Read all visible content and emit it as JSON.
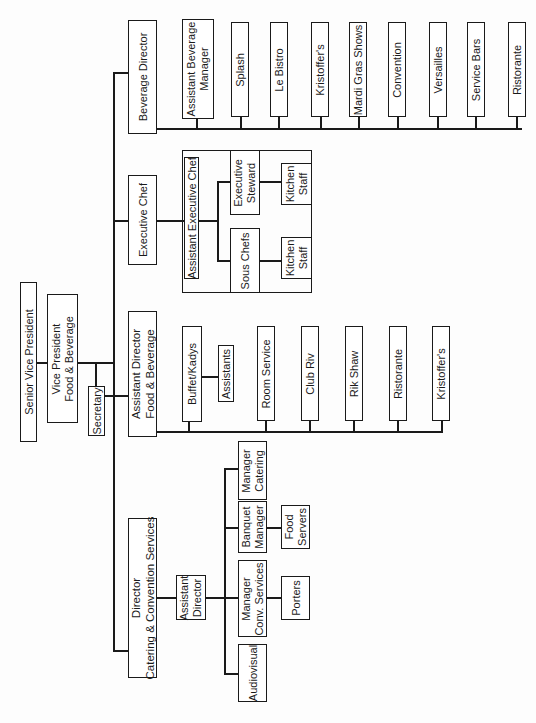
{
  "chart": {
    "orientation": "rotated-90-ccw"
  },
  "nodes": {
    "senior_vp": "Senior Vice President",
    "vp_fb": "Vice President\nFood & Beverage",
    "secretary": "Secretary",
    "beverage_director": "Beverage Director",
    "executive_chef": "Executive Chef",
    "asst_director_fb": "Assistant Director\nFood & Beverage",
    "director_catering": "Director\nCatering & Convention Services",
    "asst_beverage_manager": "Assistant Beverage\nManager",
    "splash": "Splash",
    "le_bistro": "Le Bistro",
    "kristoffers_bev": "Kristoffer's",
    "mardi_gras": "Mardi Gras Shows",
    "convention": "Convention",
    "versailles": "Versailles",
    "service_bars": "Service Bars",
    "ristorante_bev": "Ristorante",
    "asst_exec_chef": "Assistant Executive Chef",
    "executive_steward": "Executive\nSteward",
    "sous_chefs": "Sous Chefs",
    "kitchen_staff_1": "Kitchen\nStaff",
    "kitchen_staff_2": "Kitchen\nStaff",
    "buffet_kadys": "Buffet/Kadys",
    "assistants": "Assistants",
    "room_service": "Room Service",
    "club_riv": "Club Riv",
    "rik_shaw": "Rik Shaw",
    "ristorante_fb": "Ristorante",
    "kristoffers_fb": "Kristoffer's",
    "asst_director_cat": "Assistant\nDirector",
    "manager_catering": "Manager\nCatering",
    "banquet_manager": "Banquet\nManager",
    "food_servers": "Food\nServers",
    "manager_conv": "Manager\nConv. Services",
    "porters": "Porters",
    "audiovisual": "Audiovisual"
  }
}
